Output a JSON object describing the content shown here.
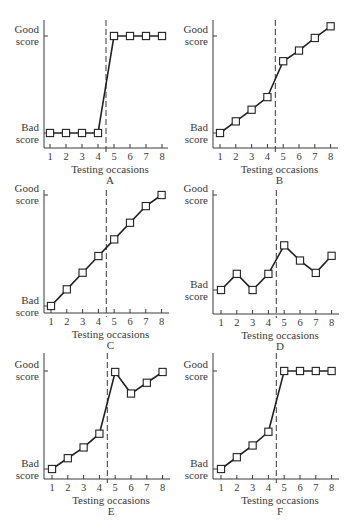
{
  "chart_data": [
    {
      "type": "line",
      "panel": "A",
      "title": "A",
      "xlabel": "Testing occasions",
      "ylabel_top": [
        "Good",
        "score"
      ],
      "ylabel_bottom": [
        "Bad",
        "score"
      ],
      "x": [
        1,
        2,
        3,
        4,
        5,
        6,
        7,
        8
      ],
      "values": [
        0,
        0,
        0,
        0,
        1,
        1,
        1,
        1
      ],
      "y_scale": "0 = Bad score, 1 = Good score",
      "intervention_line_x": 4.5,
      "origin": {
        "x": 44,
        "y": 148
      },
      "good_y": 36,
      "bad_y": 133,
      "top_y": 20,
      "x_start": 50,
      "x_step": 16,
      "x_end": 168
    },
    {
      "type": "line",
      "panel": "B",
      "title": "B",
      "xlabel": "Testing occasions",
      "ylabel_top": [
        "Good",
        "score"
      ],
      "ylabel_bottom": [
        "Bad",
        "score"
      ],
      "x": [
        1,
        2,
        3,
        4,
        5,
        6,
        7,
        8
      ],
      "values": [
        0,
        0.12,
        0.24,
        0.37,
        0.74,
        0.85,
        0.98,
        1.1
      ],
      "y_scale": "0 = Bad score, 1 = Good score",
      "intervention_line_x": 4.5,
      "origin": {
        "x": 213,
        "y": 148
      },
      "good_y": 36,
      "bad_y": 133,
      "top_y": 20,
      "x_start": 220,
      "x_step": 15.8,
      "x_end": 338
    },
    {
      "type": "line",
      "panel": "C",
      "title": "C",
      "xlabel": "Testing occasions",
      "ylabel_top": [
        "Good",
        "score"
      ],
      "ylabel_bottom": [
        "Bad",
        "score"
      ],
      "x": [
        1,
        2,
        3,
        4,
        5,
        6,
        7,
        8
      ],
      "values": [
        0,
        0.15,
        0.3,
        0.45,
        0.6,
        0.75,
        0.9,
        1.0
      ],
      "y_scale": "0 = Bad score, 1 = Good score",
      "intervention_line_x": 4.5,
      "origin": {
        "x": 44,
        "y": 313
      },
      "good_y": 195,
      "bad_y": 306,
      "top_y": 190,
      "x_start": 51,
      "x_step": 15.8,
      "x_end": 169
    },
    {
      "type": "line",
      "panel": "D",
      "title": "D",
      "xlabel": "Testing occasions",
      "ylabel_top": [
        "Good",
        "score"
      ],
      "ylabel_bottom": [
        "Bad",
        "score"
      ],
      "x": [
        1,
        2,
        3,
        4,
        5,
        6,
        7,
        8
      ],
      "values": [
        0,
        0.17,
        0,
        0.17,
        0.47,
        0.31,
        0.18,
        0.36
      ],
      "y_scale": "0 = Bad score, 1 = Good score",
      "intervention_line_x": 4.5,
      "origin": {
        "x": 213,
        "y": 314
      },
      "good_y": 195,
      "bad_y": 290,
      "top_y": 190,
      "x_start": 221,
      "x_step": 15.8,
      "x_end": 339
    },
    {
      "type": "line",
      "panel": "E",
      "title": "E",
      "xlabel": "Testing occasions",
      "ylabel_top": [
        "Good",
        "score"
      ],
      "ylabel_bottom": [
        "Bad",
        "score"
      ],
      "x": [
        1,
        2,
        3,
        4,
        5,
        6,
        7,
        8
      ],
      "values": [
        0,
        0.11,
        0.22,
        0.36,
        0.99,
        0.77,
        0.88,
        0.99
      ],
      "y_scale": "0 = Bad score, 1 = Good score",
      "intervention_line_x": 4.5,
      "origin": {
        "x": 44,
        "y": 479
      },
      "good_y": 371,
      "bad_y": 469,
      "top_y": 353,
      "x_start": 52,
      "x_step": 15.8,
      "x_end": 170
    },
    {
      "type": "line",
      "panel": "F",
      "title": "F",
      "xlabel": "Testing occasions",
      "ylabel_top": [
        "Good",
        "score"
      ],
      "ylabel_bottom": [
        "Bad",
        "score"
      ],
      "x": [
        1,
        2,
        3,
        4,
        5,
        6,
        7,
        8
      ],
      "values": [
        0,
        0.12,
        0.24,
        0.38,
        1,
        1,
        1,
        1
      ],
      "y_scale": "0 = Bad score, 1 = Good score",
      "intervention_line_x": 4.5,
      "origin": {
        "x": 213,
        "y": 479
      },
      "good_y": 371,
      "bad_y": 469,
      "top_y": 353,
      "x_start": 221,
      "x_step": 15.8,
      "x_end": 339
    }
  ],
  "colors": {
    "background": "#ffffff",
    "ink": "#222222",
    "axis": "#3a3a3a",
    "marker_fill": "#ffffff"
  }
}
